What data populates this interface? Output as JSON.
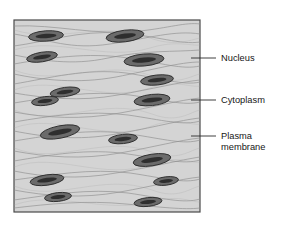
{
  "figure": {
    "kind": "smooth-muscle-tissue-diagram",
    "colors": {
      "tissue_fill": "#d4d4d4",
      "tissue_border": "#4a4a4a",
      "fiber_line": "#8e8e8e",
      "nucleus_fill": "#6b6b6b",
      "nucleus_core": "#2e2e2e",
      "label_text": "#161616",
      "leader_line": "#2b2b2b",
      "page_background": "#ffffff"
    },
    "tissue_box": {
      "x": 14,
      "y": 20,
      "width": 186,
      "height": 192
    },
    "labels": [
      {
        "id": "nucleus",
        "lines": [
          "Nucleus"
        ],
        "text_x": 221,
        "text_y": 61,
        "leader": {
          "x1": 191,
          "y1": 58,
          "x2": 216,
          "y2": 58
        }
      },
      {
        "id": "cytoplasm",
        "lines": [
          "Cytoplasm"
        ],
        "text_x": 221,
        "text_y": 103,
        "leader": {
          "x1": 191,
          "y1": 100,
          "x2": 216,
          "y2": 100
        }
      },
      {
        "id": "plasma-membrane",
        "lines": [
          "Plasma",
          "membrane"
        ],
        "text_x": 221,
        "text_y": 139,
        "line_height": 11,
        "leader": {
          "x1": 191,
          "y1": 136,
          "x2": 216,
          "y2": 136
        }
      }
    ],
    "nuclei": [
      {
        "cx": 46,
        "cy": 36,
        "rx": 17.5,
        "ry": 5.2,
        "rot": -4,
        "irx": 10.5,
        "iry": 2.2
      },
      {
        "cx": 125,
        "cy": 36,
        "rx": 19.0,
        "ry": 5.8,
        "rot": -7,
        "irx": 11.0,
        "iry": 2.4
      },
      {
        "cx": 42,
        "cy": 57,
        "rx": 15.5,
        "ry": 4.8,
        "rot": -9,
        "irx": 9.0,
        "iry": 2.1
      },
      {
        "cx": 144,
        "cy": 60,
        "rx": 20.0,
        "ry": 6.0,
        "rot": -5,
        "irx": 12.0,
        "iry": 2.5
      },
      {
        "cx": 157,
        "cy": 80,
        "rx": 16.5,
        "ry": 5.0,
        "rot": -6,
        "irx": 9.5,
        "iry": 2.1
      },
      {
        "cx": 65,
        "cy": 92,
        "rx": 15.0,
        "ry": 4.6,
        "rot": -8,
        "irx": 8.5,
        "iry": 2.0
      },
      {
        "cx": 152,
        "cy": 100,
        "rx": 18.0,
        "ry": 5.6,
        "rot": -6,
        "irx": 10.5,
        "iry": 2.3
      },
      {
        "cx": 45,
        "cy": 101,
        "rx": 13.5,
        "ry": 4.4,
        "rot": -7,
        "irx": 7.5,
        "iry": 1.9
      },
      {
        "cx": 60,
        "cy": 132,
        "rx": 20.0,
        "ry": 6.2,
        "rot": -11,
        "irx": 12.0,
        "iry": 2.6
      },
      {
        "cx": 123,
        "cy": 139,
        "rx": 14.5,
        "ry": 4.6,
        "rot": -6,
        "irx": 8.5,
        "iry": 2.0
      },
      {
        "cx": 152,
        "cy": 160,
        "rx": 19.0,
        "ry": 5.8,
        "rot": -9,
        "irx": 11.0,
        "iry": 2.4
      },
      {
        "cx": 47,
        "cy": 180,
        "rx": 17.0,
        "ry": 5.2,
        "rot": -8,
        "irx": 10.0,
        "iry": 2.2
      },
      {
        "cx": 166,
        "cy": 181,
        "rx": 12.5,
        "ry": 4.2,
        "rot": -7,
        "irx": 7.0,
        "iry": 1.8
      },
      {
        "cx": 58,
        "cy": 197,
        "rx": 13.5,
        "ry": 4.4,
        "rot": -6,
        "irx": 7.5,
        "iry": 1.9
      },
      {
        "cx": 148,
        "cy": 202,
        "rx": 14.0,
        "ry": 4.4,
        "rot": -6,
        "irx": 8.0,
        "iry": 1.9
      }
    ],
    "fibers": [
      "M14,26 C55,24 95,36 140,31 C168,28 186,22 200,24",
      "M14,34 C50,40 70,50 110,44 C150,38 175,30 200,34",
      "M14,46 C45,42 80,30 120,33 C158,36 180,45 200,42",
      "M14,55 C40,60 72,66 108,58 C145,50 175,52 200,50",
      "M14,64 C48,58 88,52 128,58 C162,63 182,70 200,66",
      "M14,74 C42,80 78,84 116,77 C152,70 180,62 200,62",
      "M14,84 C50,78 86,68 126,73 C160,78 184,86 200,82",
      "M14,93 C44,98 80,102 118,95 C152,89 180,82 200,80",
      "M14,103 C52,97 90,90 130,95 C164,100 184,106 200,102",
      "M14,112 C46,118 82,120 120,113 C154,107 180,100 200,98",
      "M14,122 C50,116 88,110 128,115 C162,120 184,126 200,121",
      "M14,131 C44,137 78,141 116,134 C152,128 180,120 200,118",
      "M14,141 C52,135 90,128 130,134 C164,139 184,145 200,140",
      "M14,151 C46,157 82,160 120,153 C154,147 180,140 200,138",
      "M14,161 C50,155 88,148 128,154 C162,159 184,165 200,160",
      "M14,171 C44,177 78,180 116,173 C152,167 180,160 200,157",
      "M14,180 C52,175 90,168 130,173 C164,178 184,184 200,179",
      "M14,190 C46,196 82,199 120,192 C154,186 180,179 200,177",
      "M14,200 C50,195 88,188 128,193 C162,198 184,204 200,199",
      "M14,208 C48,204 86,200 126,204 C160,207 184,210 200,208"
    ],
    "fibers_faint": [
      "M14,30 C60,44 100,20 150,38 C175,47 190,40 200,38",
      "M14,50 C58,36 104,62 150,48 C176,40 190,46 200,45",
      "M14,70 C58,88 104,58 152,76 C178,86 190,76 200,74",
      "M14,90 C56,74 102,104 150,88 C176,79 190,88 200,86",
      "M14,110 C58,128 102,96 152,114 C178,124 190,112 200,110",
      "M14,128 C56,112 104,144 152,126 C178,116 190,126 200,124",
      "M14,148 C58,166 102,134 152,152 C178,162 190,150 200,148",
      "M14,167 C56,151 104,182 152,164 C178,154 190,164 200,162",
      "M14,186 C58,203 102,172 152,190 C178,200 190,188 200,186",
      "M14,205 C56,190 104,214 152,202 C178,194 190,202 200,202"
    ]
  }
}
